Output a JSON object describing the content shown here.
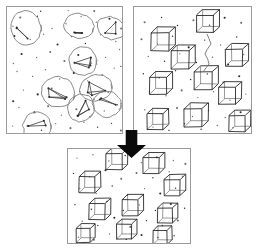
{
  "figure": {
    "title": "",
    "background_color": "#ffffff",
    "width": 257,
    "height": 250
  },
  "panels": [
    {
      "id": "top-left",
      "name": "input-point-cloud-with-ellipse-annotations",
      "x": 6,
      "y": 6,
      "w": 116,
      "h": 127,
      "border_color": "#9a9a9a",
      "fill_color": "#ffffff",
      "content_type": "scatter-with-hand-drawn-ellipses"
    },
    {
      "id": "top-right",
      "name": "detected-wireframe-cubes",
      "x": 133,
      "y": 6,
      "w": 118,
      "h": 127,
      "border_color": "#9a9a9a",
      "fill_color": "#ffffff",
      "content_type": "scatter-with-wireframe-cubes"
    },
    {
      "id": "bottom",
      "name": "result-wireframe-cubes",
      "x": 67,
      "y": 148,
      "w": 123,
      "h": 95,
      "border_color": "#9a9a9a",
      "fill_color": "#ffffff",
      "content_type": "scatter-with-wireframe-cubes"
    }
  ],
  "arrow": {
    "name": "downward-transform-arrow",
    "direction": "down",
    "color": "#0a0a0a",
    "x": 117,
    "y": 130,
    "w": 29,
    "h": 28
  },
  "chart_data": {
    "type": "scatter",
    "title": "",
    "xlabel": "",
    "ylabel": "",
    "grid": false,
    "legend_position": "none",
    "panels": [
      {
        "panel": "top-left",
        "xlim": [
          0,
          116
        ],
        "ylim": [
          0,
          127
        ],
        "points": [
          [
            14,
            12
          ],
          [
            31,
            10
          ],
          [
            46,
            22
          ],
          [
            60,
            18
          ],
          [
            75,
            11
          ],
          [
            90,
            16
          ],
          [
            104,
            13
          ],
          [
            9,
            30
          ],
          [
            24,
            34
          ],
          [
            38,
            28
          ],
          [
            52,
            39
          ],
          [
            66,
            31
          ],
          [
            80,
            37
          ],
          [
            95,
            29
          ],
          [
            110,
            35
          ],
          [
            16,
            48
          ],
          [
            30,
            52
          ],
          [
            44,
            46
          ],
          [
            58,
            55
          ],
          [
            72,
            49
          ],
          [
            86,
            57
          ],
          [
            100,
            51
          ],
          [
            113,
            44
          ],
          [
            11,
            66
          ],
          [
            26,
            70
          ],
          [
            40,
            64
          ],
          [
            54,
            73
          ],
          [
            68,
            67
          ],
          [
            82,
            75
          ],
          [
            96,
            69
          ],
          [
            108,
            62
          ],
          [
            18,
            84
          ],
          [
            32,
            88
          ],
          [
            46,
            82
          ],
          [
            60,
            91
          ],
          [
            74,
            85
          ],
          [
            88,
            93
          ],
          [
            102,
            87
          ],
          [
            13,
            102
          ],
          [
            28,
            106
          ],
          [
            42,
            100
          ],
          [
            56,
            109
          ],
          [
            70,
            103
          ],
          [
            84,
            111
          ],
          [
            98,
            105
          ],
          [
            111,
            99
          ],
          [
            21,
            120
          ],
          [
            36,
            124
          ],
          [
            50,
            118
          ],
          [
            64,
            122
          ],
          [
            78,
            116
          ],
          [
            92,
            121
          ],
          [
            106,
            117
          ],
          [
            7,
            20
          ],
          [
            7,
            57
          ],
          [
            7,
            95
          ],
          [
            7,
            120
          ],
          [
            115,
            22
          ],
          [
            115,
            60
          ],
          [
            115,
            98
          ],
          [
            115,
            125
          ],
          [
            35,
            5
          ],
          [
            62,
            5
          ],
          [
            88,
            5
          ],
          [
            35,
            130
          ],
          [
            62,
            130
          ],
          [
            88,
            130
          ]
        ],
        "annotations": [
          {
            "type": "ellipse",
            "cx": 20,
            "cy": 22,
            "rx": 15,
            "ry": 17,
            "rotation": -12
          },
          {
            "type": "ellipse",
            "cx": 73,
            "cy": 20,
            "rx": 15,
            "ry": 12,
            "rotation": 8
          },
          {
            "type": "ellipse",
            "cx": 105,
            "cy": 22,
            "rx": 14,
            "ry": 11,
            "rotation": 20
          },
          {
            "type": "ellipse",
            "cx": 77,
            "cy": 55,
            "rx": 14,
            "ry": 14,
            "rotation": -5
          },
          {
            "type": "ellipse",
            "cx": 52,
            "cy": 86,
            "rx": 17,
            "ry": 15,
            "rotation": 10
          },
          {
            "type": "ellipse",
            "cx": 90,
            "cy": 82,
            "rx": 16,
            "ry": 13,
            "rotation": -15
          },
          {
            "type": "ellipse",
            "cx": 101,
            "cy": 98,
            "rx": 14,
            "ry": 13,
            "rotation": 5
          },
          {
            "type": "ellipse",
            "cx": 75,
            "cy": 102,
            "rx": 13,
            "ry": 14,
            "rotation": 25
          },
          {
            "type": "ellipse",
            "cx": 31,
            "cy": 120,
            "rx": 14,
            "ry": 14,
            "rotation": -8
          }
        ]
      },
      {
        "panel": "top-right",
        "xlim": [
          0,
          118
        ],
        "ylim": [
          0,
          127
        ],
        "points": [
          [
            12,
            16
          ],
          [
            28,
            11
          ],
          [
            44,
            20
          ],
          [
            60,
            14
          ],
          [
            76,
            19
          ],
          [
            92,
            12
          ],
          [
            108,
            17
          ],
          [
            8,
            33
          ],
          [
            24,
            38
          ],
          [
            40,
            30
          ],
          [
            56,
            41
          ],
          [
            72,
            34
          ],
          [
            88,
            39
          ],
          [
            104,
            31
          ],
          [
            15,
            50
          ],
          [
            31,
            55
          ],
          [
            47,
            48
          ],
          [
            63,
            57
          ],
          [
            79,
            51
          ],
          [
            95,
            58
          ],
          [
            111,
            49
          ],
          [
            10,
            68
          ],
          [
            26,
            72
          ],
          [
            42,
            65
          ],
          [
            58,
            74
          ],
          [
            74,
            68
          ],
          [
            90,
            76
          ],
          [
            106,
            70
          ],
          [
            17,
            86
          ],
          [
            33,
            90
          ],
          [
            49,
            84
          ],
          [
            65,
            92
          ],
          [
            81,
            86
          ],
          [
            97,
            94
          ],
          [
            113,
            88
          ],
          [
            12,
            104
          ],
          [
            28,
            108
          ],
          [
            44,
            102
          ],
          [
            60,
            110
          ],
          [
            76,
            104
          ],
          [
            92,
            112
          ],
          [
            108,
            106
          ],
          [
            20,
            121
          ],
          [
            36,
            124
          ],
          [
            52,
            118
          ],
          [
            68,
            123
          ],
          [
            84,
            119
          ],
          [
            100,
            122
          ]
        ],
        "cubes": [
          {
            "cx": 27,
            "cy": 34,
            "size": 18
          },
          {
            "cx": 72,
            "cy": 16,
            "size": 17
          },
          {
            "cx": 47,
            "cy": 52,
            "size": 18
          },
          {
            "cx": 101,
            "cy": 50,
            "size": 17
          },
          {
            "cx": 25,
            "cy": 78,
            "size": 17
          },
          {
            "cx": 70,
            "cy": 73,
            "size": 18
          },
          {
            "cx": 94,
            "cy": 88,
            "size": 17
          },
          {
            "cx": 60,
            "cy": 110,
            "size": 18
          },
          {
            "cx": 22,
            "cy": 114,
            "size": 16
          },
          {
            "cx": 104,
            "cy": 116,
            "size": 16
          }
        ],
        "connector": {
          "type": "squiggle",
          "from_cube": 1,
          "to_cube": 5,
          "points": [
            [
              74,
              28
            ],
            [
              78,
              38
            ],
            [
              72,
              48
            ],
            [
              76,
              58
            ],
            [
              70,
              66
            ]
          ]
        }
      },
      {
        "panel": "bottom",
        "xlim": [
          0,
          123
        ],
        "ylim": [
          0,
          95
        ],
        "points": [
          [
            10,
            10
          ],
          [
            26,
            7
          ],
          [
            42,
            13
          ],
          [
            58,
            8
          ],
          [
            74,
            14
          ],
          [
            90,
            9
          ],
          [
            106,
            12
          ],
          [
            118,
            16
          ],
          [
            6,
            25
          ],
          [
            22,
            29
          ],
          [
            38,
            22
          ],
          [
            54,
            31
          ],
          [
            70,
            25
          ],
          [
            86,
            30
          ],
          [
            102,
            24
          ],
          [
            116,
            28
          ],
          [
            13,
            41
          ],
          [
            29,
            45
          ],
          [
            45,
            38
          ],
          [
            61,
            47
          ],
          [
            77,
            41
          ],
          [
            93,
            46
          ],
          [
            109,
            40
          ],
          [
            8,
            57
          ],
          [
            24,
            61
          ],
          [
            40,
            54
          ],
          [
            56,
            63
          ],
          [
            72,
            57
          ],
          [
            88,
            62
          ],
          [
            104,
            56
          ],
          [
            118,
            60
          ],
          [
            15,
            73
          ],
          [
            31,
            77
          ],
          [
            47,
            70
          ],
          [
            63,
            79
          ],
          [
            79,
            73
          ],
          [
            95,
            78
          ],
          [
            111,
            72
          ],
          [
            11,
            89
          ],
          [
            27,
            92
          ],
          [
            43,
            86
          ],
          [
            59,
            91
          ],
          [
            75,
            87
          ],
          [
            91,
            90
          ],
          [
            107,
            88
          ]
        ],
        "cubes": [
          {
            "cx": 47,
            "cy": 12,
            "size": 16
          },
          {
            "cx": 84,
            "cy": 16,
            "size": 16
          },
          {
            "cx": 20,
            "cy": 35,
            "size": 16
          },
          {
            "cx": 105,
            "cy": 38,
            "size": 16
          },
          {
            "cx": 30,
            "cy": 62,
            "size": 16
          },
          {
            "cx": 63,
            "cy": 58,
            "size": 16
          },
          {
            "cx": 98,
            "cy": 66,
            "size": 15
          },
          {
            "cx": 57,
            "cy": 82,
            "size": 15
          },
          {
            "cx": 16,
            "cy": 86,
            "size": 14
          },
          {
            "cx": 93,
            "cy": 88,
            "size": 14
          }
        ]
      }
    ]
  }
}
